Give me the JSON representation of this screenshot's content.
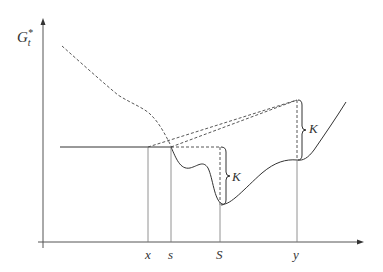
{
  "diagram": {
    "y_axis_label": "G",
    "y_axis_label_sub": "t",
    "y_axis_label_sup": "*",
    "x_ticks": [
      {
        "label": "x",
        "pos": 148
      },
      {
        "label": "s",
        "pos": 171
      },
      {
        "label": "S",
        "pos": 220
      },
      {
        "label": "y",
        "pos": 297
      }
    ],
    "brace_labels": {
      "lower": "K",
      "upper": "K"
    }
  }
}
